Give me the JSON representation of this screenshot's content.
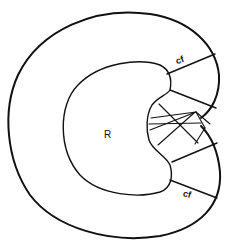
{
  "diagram": {
    "type": "schematic",
    "labels": {
      "region": "R",
      "upper_segment": "cf",
      "lower_segment": "cf"
    },
    "colors": {
      "ink": "#111111",
      "background": "#ffffff"
    }
  }
}
